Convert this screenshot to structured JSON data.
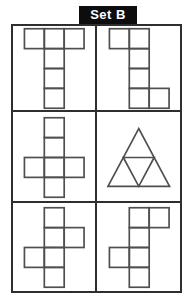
{
  "title": "Set B",
  "colors": {
    "background": "#ffffff",
    "label_bg": "#0d0d0d",
    "label_text": "#ffffff",
    "grid_line": "#2e2e2e",
    "shape_line": "#4f4f4f"
  },
  "grid": {
    "rows": 3,
    "cols": 2
  },
  "cells": [
    {
      "id": "top-left",
      "name": "t-shape-hexomino",
      "shape": "polyomino",
      "unit": 20,
      "squares": [
        [
          0,
          0
        ],
        [
          1,
          0
        ],
        [
          2,
          0
        ],
        [
          1,
          1
        ],
        [
          1,
          2
        ],
        [
          1,
          3
        ]
      ]
    },
    {
      "id": "top-right",
      "name": "z-shape-hexomino",
      "shape": "polyomino",
      "unit": 20,
      "squares": [
        [
          0,
          0
        ],
        [
          1,
          0
        ],
        [
          1,
          1
        ],
        [
          1,
          2
        ],
        [
          1,
          3
        ],
        [
          2,
          3
        ]
      ]
    },
    {
      "id": "middle-left",
      "name": "cross-hexomino",
      "shape": "polyomino",
      "unit": 20,
      "squares": [
        [
          1,
          0
        ],
        [
          1,
          1
        ],
        [
          0,
          2
        ],
        [
          1,
          2
        ],
        [
          2,
          2
        ],
        [
          1,
          3
        ]
      ]
    },
    {
      "id": "middle-right",
      "name": "triangle-subdivided-into-four",
      "shape": "triangle-subdivided",
      "width": 62,
      "height": 58
    },
    {
      "id": "bottom-left",
      "name": "zigzag-cross-hexomino-right-arm-high",
      "shape": "polyomino",
      "unit": 20,
      "squares": [
        [
          1,
          0
        ],
        [
          1,
          1
        ],
        [
          2,
          1
        ],
        [
          0,
          2
        ],
        [
          1,
          2
        ],
        [
          1,
          3
        ]
      ]
    },
    {
      "id": "bottom-right",
      "name": "zigzag-cross-hexomino-top-right-arm",
      "shape": "polyomino",
      "unit": 20,
      "squares": [
        [
          1,
          0
        ],
        [
          2,
          0
        ],
        [
          1,
          1
        ],
        [
          0,
          2
        ],
        [
          1,
          2
        ],
        [
          1,
          3
        ]
      ]
    }
  ]
}
